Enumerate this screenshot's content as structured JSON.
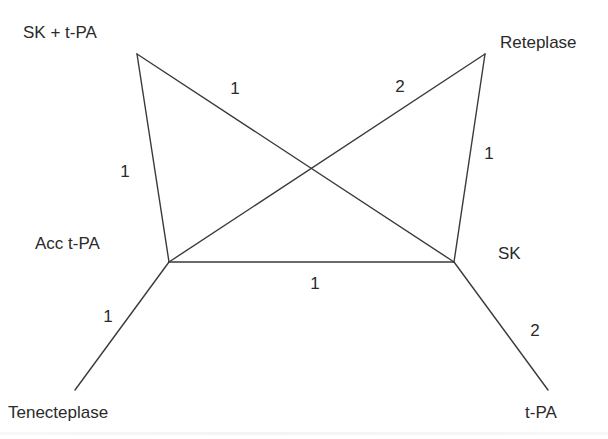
{
  "diagram": {
    "type": "network-meta-analysis graph",
    "nodes": [
      {
        "id": "sk_tpa",
        "label": "SK + t-PA",
        "x": 137,
        "y": 54,
        "label_x": 23,
        "label_y": 38
      },
      {
        "id": "reteplase",
        "label": "Reteplase",
        "x": 485,
        "y": 54,
        "label_x": 500,
        "label_y": 48
      },
      {
        "id": "acc_tpa",
        "label": "Acc t-PA",
        "x": 169,
        "y": 262,
        "label_x": 35,
        "label_y": 249
      },
      {
        "id": "sk",
        "label": "SK",
        "x": 454,
        "y": 262,
        "label_x": 498,
        "label_y": 259
      },
      {
        "id": "tenecteplase",
        "label": "Tenecteplase",
        "x": 75,
        "y": 390,
        "label_x": 8,
        "label_y": 418
      },
      {
        "id": "tpa",
        "label": "t-PA",
        "x": 548,
        "y": 390,
        "label_x": 525,
        "label_y": 418
      }
    ],
    "edges": [
      {
        "from": "sk_tpa",
        "to": "sk",
        "weight": "1",
        "label_x": 235,
        "label_y": 94
      },
      {
        "from": "sk_tpa",
        "to": "acc_tpa",
        "weight": "1",
        "label_x": 125,
        "label_y": 177
      },
      {
        "from": "reteplase",
        "to": "acc_tpa",
        "weight": "2",
        "label_x": 400,
        "label_y": 92
      },
      {
        "from": "reteplase",
        "to": "sk",
        "weight": "1",
        "label_x": 489,
        "label_y": 159
      },
      {
        "from": "acc_tpa",
        "to": "sk",
        "weight": "1",
        "label_x": 315,
        "label_y": 289
      },
      {
        "from": "acc_tpa",
        "to": "tenecteplase",
        "weight": "1",
        "label_x": 108,
        "label_y": 322
      },
      {
        "from": "sk",
        "to": "tpa",
        "weight": "2",
        "label_x": 535,
        "label_y": 336
      }
    ]
  }
}
